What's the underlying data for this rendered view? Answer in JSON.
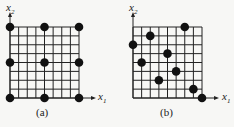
{
  "panels": [
    {
      "id": "a",
      "caption": "(a)",
      "x_axis_label": "x1",
      "y_axis_label": "x2",
      "grid": {
        "cols": 8,
        "rows": 8
      },
      "points": [
        [
          0,
          0
        ],
        [
          4,
          0
        ],
        [
          8,
          0
        ],
        [
          0,
          4
        ],
        [
          4,
          4
        ],
        [
          8,
          4
        ],
        [
          0,
          8
        ],
        [
          4,
          8
        ],
        [
          8,
          8
        ]
      ]
    },
    {
      "id": "b",
      "caption": "(b)",
      "x_axis_label": "x1",
      "y_axis_label": "x2",
      "grid": {
        "cols": 8,
        "rows": 8
      },
      "points": [
        [
          0,
          6
        ],
        [
          2,
          7
        ],
        [
          6,
          8
        ],
        [
          1,
          4
        ],
        [
          4,
          5
        ],
        [
          3,
          2
        ],
        [
          5,
          3
        ],
        [
          7,
          1
        ],
        [
          8,
          0
        ]
      ]
    }
  ],
  "colors": {
    "line": "#222222",
    "dot": "#111111",
    "background": "#f7f7f5"
  }
}
